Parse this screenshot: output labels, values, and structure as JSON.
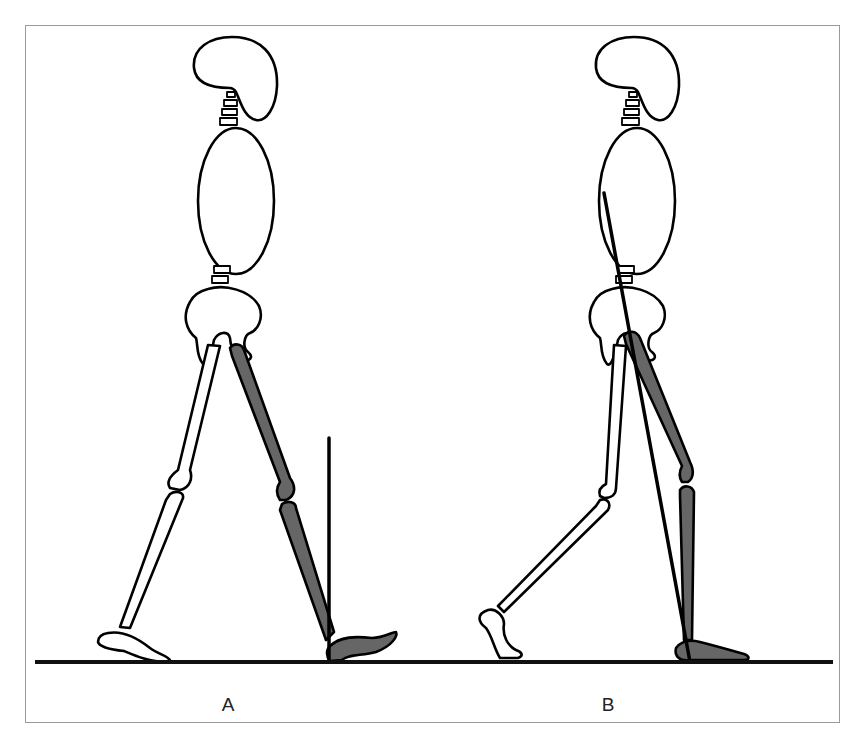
{
  "figure": {
    "panels": [
      {
        "id": "A",
        "label": "A",
        "reference_line": "vertical line at stance foot (ankle)"
      },
      {
        "id": "B",
        "label": "B",
        "reference_line": "oblique line from trunk through hip to stance foot"
      }
    ],
    "colors": {
      "outline": "#000000",
      "stance_leg_fill": "#666666",
      "swing_leg_fill": "#ffffff",
      "frame_border": "#9a9a9a",
      "ground": "#111111"
    }
  }
}
